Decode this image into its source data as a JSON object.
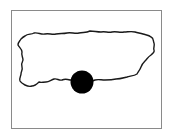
{
  "map": {
    "region": "Puerto Rico",
    "outline_color": "#1a1a1a",
    "frame_color": "#8a8a8a",
    "background": "#ffffff",
    "marker": {
      "shape": "circle",
      "color": "#000000",
      "cx": 82,
      "cy": 82,
      "r": 11.5
    }
  }
}
